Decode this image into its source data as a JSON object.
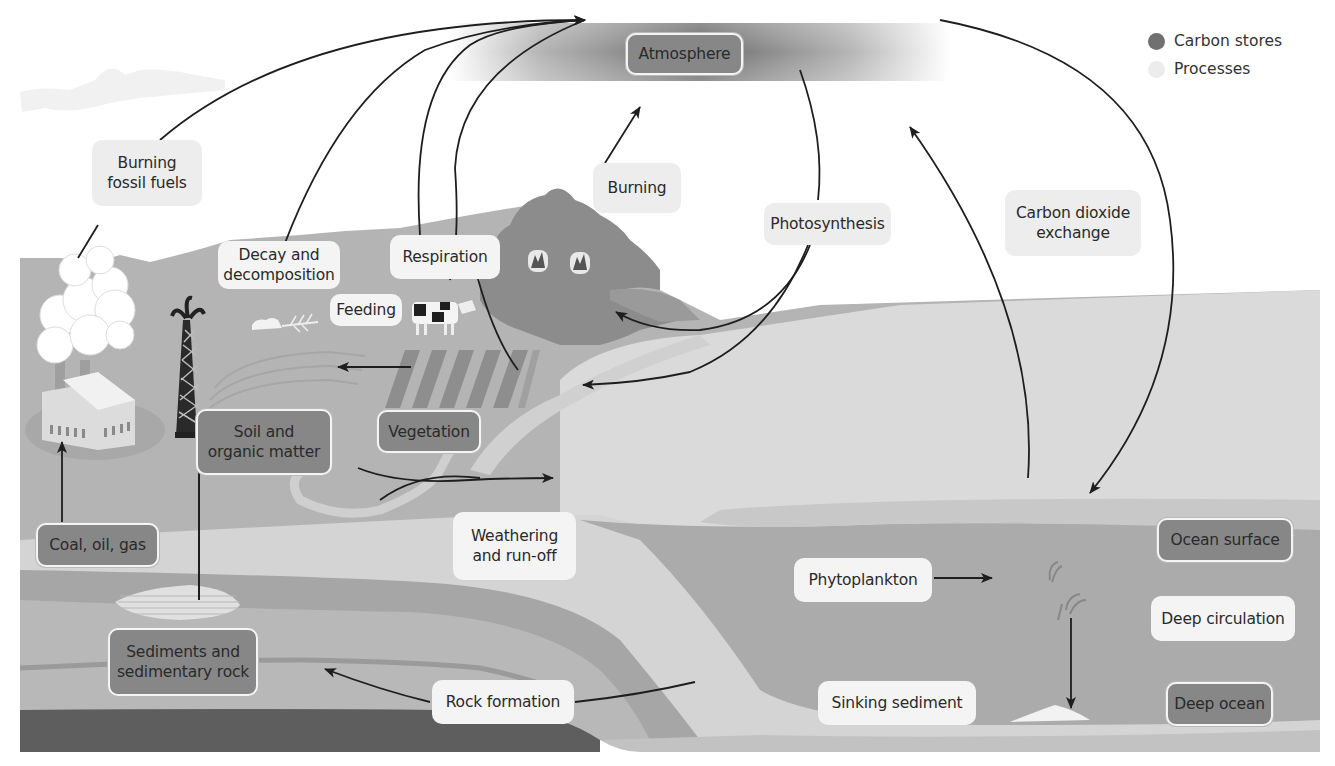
{
  "diagram": {
    "colors": {
      "store_fill": "#878787",
      "process_fill": "#ededed",
      "arrow": "#1e1e1e",
      "land": "#b2b2b2",
      "forest": "#8a8a8a",
      "ocean_surface": "#d6d6d6",
      "ocean_deep": "#b0b0b0",
      "rock_layer": "#a0a0a0",
      "bedrock": "#606060"
    },
    "legend": {
      "items": [
        {
          "label": "Carbon stores",
          "swatch": "#707070"
        },
        {
          "label": "Processes",
          "swatch": "#eaeaea"
        }
      ]
    },
    "stores": {
      "atmosphere": "Atmosphere",
      "soil": "Soil and\norganic matter",
      "vegetation": "Vegetation",
      "fossil": "Coal, oil, gas",
      "sediments": "Sediments and\nsedimentary rock",
      "ocean_surface": "Ocean surface",
      "deep_ocean": "Deep ocean"
    },
    "processes": {
      "burning_fossil": "Burning\nfossil fuels",
      "decay": "Decay and\ndecomposition",
      "respiration": "Respiration",
      "feeding": "Feeding",
      "burning": "Burning",
      "photosynthesis": "Photosynthesis",
      "co2_exchange": "Carbon dioxide\nexchange",
      "weathering": "Weathering\nand run-off",
      "rock_formation": "Rock formation",
      "phytoplankton": "Phytoplankton",
      "deep_circulation": "Deep circulation",
      "sinking_sediment": "Sinking sediment"
    }
  }
}
